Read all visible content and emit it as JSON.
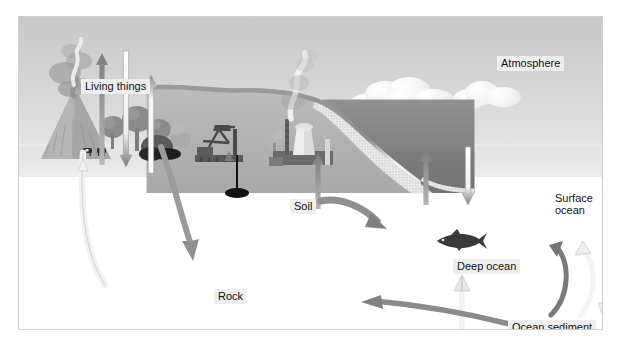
{
  "diagram": {
    "canvas": {
      "width": 621,
      "height": 346
    }
  },
  "labels": {
    "living_things": "Living things",
    "atmosphere": "Atmosphere",
    "soil": "Soil",
    "rock": "Rock",
    "surface_ocean_line1": "Surface",
    "surface_ocean_line2": "ocean",
    "deep_ocean": "Deep ocean",
    "ocean_sediment": "Ocean sediment"
  },
  "colors": {
    "sky_top": "#c9c9c9",
    "sky_bottom": "#ededed",
    "rock": "#b4b4b4",
    "ocean": "#838383",
    "sediment": "#f0f0f0",
    "arrow_dark": "#7a7a7a",
    "arrow_light": "#fbfbfb",
    "label_box": "#eeeeee",
    "label_text": "#111111",
    "frame": "#cfcfcf"
  },
  "elements": {
    "clouds": [
      {
        "name": "cloud-large"
      },
      {
        "name": "cloud-small"
      }
    ],
    "scenery": [
      {
        "name": "volcano"
      },
      {
        "name": "trees"
      },
      {
        "name": "cattle"
      },
      {
        "name": "burning-vegetation"
      },
      {
        "name": "oil-pumpjack"
      },
      {
        "name": "power-plant"
      },
      {
        "name": "fish"
      }
    ],
    "arrows": [
      {
        "name": "arrow-living-things-up-dark",
        "direction": "up",
        "tone": "dark"
      },
      {
        "name": "arrow-living-things-down-light",
        "direction": "down",
        "tone": "light"
      },
      {
        "name": "arrow-living-things-up-light",
        "direction": "up",
        "tone": "light"
      },
      {
        "name": "arrow-soil-up-dark",
        "direction": "up",
        "tone": "dark"
      },
      {
        "name": "arrow-ocean-up-dark",
        "direction": "up",
        "tone": "dark"
      },
      {
        "name": "arrow-ocean-down-light",
        "direction": "down",
        "tone": "light"
      },
      {
        "name": "arrow-volcano-conduit-light",
        "direction": "up",
        "tone": "light"
      },
      {
        "name": "arrow-rock-burial-dark",
        "direction": "down",
        "tone": "dark"
      },
      {
        "name": "arrow-oil-extraction-dark",
        "direction": "up",
        "tone": "dark"
      },
      {
        "name": "arrow-runoff-to-ocean-dark",
        "direction": "right",
        "tone": "dark"
      },
      {
        "name": "arrow-sediment-upwell-light",
        "direction": "up",
        "tone": "light"
      },
      {
        "name": "arrow-sediment-subduction-dark",
        "direction": "left",
        "tone": "dark"
      },
      {
        "name": "arrow-deep-circulation-down-dark",
        "direction": "down-curve",
        "tone": "dark"
      },
      {
        "name": "arrow-deep-circulation-up-light",
        "direction": "up-curve",
        "tone": "light"
      },
      {
        "name": "arrow-deep-sinking-light",
        "direction": "down",
        "tone": "light"
      }
    ]
  }
}
